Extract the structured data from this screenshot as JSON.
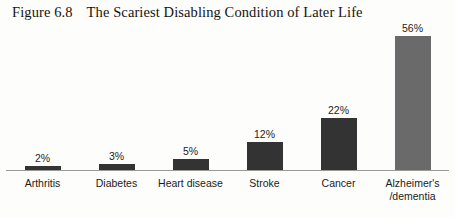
{
  "title": {
    "figure_number": "Figure 6.8",
    "text": "The Scariest Disabling Condition of Later Life",
    "full": "Figure 6.8   The Scariest Disabling Condition of Later Life"
  },
  "colors": {
    "background": "#fdfdfc",
    "bar_default": "#333333",
    "bar_highlight": "#6a6a6a",
    "axis_line": "#9a9a96",
    "text": "#1b1b1b"
  },
  "chart_data": {
    "type": "bar",
    "title": "The Scariest Disabling Condition of Later Life",
    "xlabel": "",
    "ylabel": "",
    "ylim": [
      0,
      60
    ],
    "grid": false,
    "legend": false,
    "categories": [
      "Arthritis",
      "Diabetes",
      "Heart disease",
      "Stroke",
      "Cancer",
      "Alzheimer's /dementia"
    ],
    "values": [
      2,
      3,
      5,
      12,
      22,
      56
    ],
    "value_labels": [
      "2%",
      "3%",
      "5%",
      "12%",
      "22%",
      "56%"
    ],
    "bar_colors": [
      "#333333",
      "#333333",
      "#333333",
      "#333333",
      "#333333",
      "#6a6a6a"
    ]
  },
  "bars": [
    {
      "label_lines": [
        "Arthritis"
      ],
      "value_label": "2%",
      "value": 2,
      "color": "#333333"
    },
    {
      "label_lines": [
        "Diabetes"
      ],
      "value_label": "3%",
      "value": 3,
      "color": "#333333"
    },
    {
      "label_lines": [
        "Heart disease"
      ],
      "value_label": "5%",
      "value": 5,
      "color": "#333333"
    },
    {
      "label_lines": [
        "Stroke"
      ],
      "value_label": "12%",
      "value": 12,
      "color": "#333333"
    },
    {
      "label_lines": [
        "Cancer"
      ],
      "value_label": "22%",
      "value": 22,
      "color": "#333333"
    },
    {
      "label_lines": [
        "Alzheimer's",
        "/dementia"
      ],
      "value_label": "56%",
      "value": 56,
      "color": "#6a6a6a"
    }
  ]
}
